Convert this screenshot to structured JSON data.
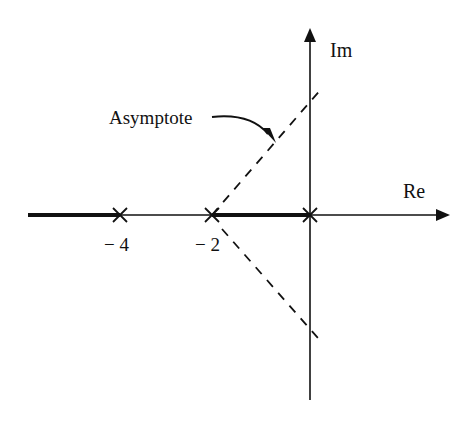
{
  "diagram": {
    "type": "root-locus",
    "axes": {
      "real_label": "Re",
      "imag_label": "Im"
    },
    "poles": [
      {
        "label": "− 4",
        "value": -4,
        "x": 120
      },
      {
        "label": "− 2",
        "value": -2,
        "x": 212
      },
      {
        "label": "",
        "value": 0,
        "x": 310
      }
    ],
    "asymptote_label": "Asymptote",
    "colors": {
      "ink": "#111111",
      "background": "#ffffff"
    }
  }
}
